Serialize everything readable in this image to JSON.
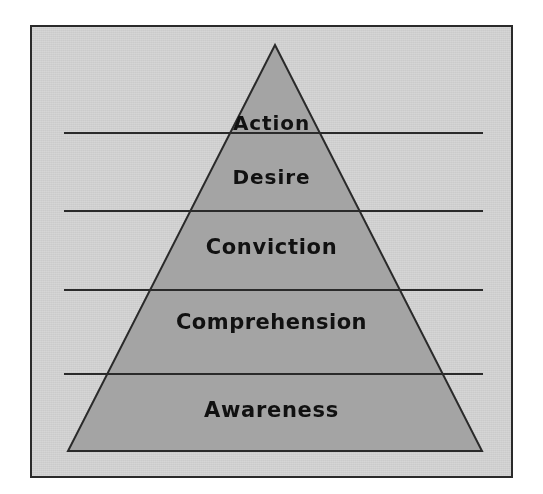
{
  "document": {
    "title": "AIDA Communication Pyramid",
    "clipped_header_text": ""
  },
  "colors": {
    "page_background": "#ffffff",
    "panel_fill": "#d6d6d6",
    "panel_border": "#2a2a2a",
    "pyramid_fill": "#a4a4a4",
    "pyramid_stroke": "#2a2a2a",
    "divider_line": "#2a2a2a",
    "label_text": "#111111"
  },
  "panel": {
    "x": 30,
    "y": 25,
    "width": 483,
    "height": 453,
    "border_width": 2
  },
  "pyramid": {
    "apex_x": 275,
    "apex_y": 45,
    "base_left_x": 68,
    "base_right_x": 482,
    "base_y": 451,
    "stroke_width": 2
  },
  "dividers": [
    {
      "name": "divider-action-desire",
      "x1": 64,
      "x2": 483,
      "y": 133
    },
    {
      "name": "divider-desire-conviction",
      "x1": 64,
      "x2": 483,
      "y": 211
    },
    {
      "name": "divider-conviction-comprehension",
      "x1": 64,
      "x2": 483,
      "y": 290
    },
    {
      "name": "divider-comprehension-awareness",
      "x1": 64,
      "x2": 483,
      "y": 374
    }
  ],
  "tiers": [
    {
      "id": "action",
      "label": "Action",
      "level": 5
    },
    {
      "id": "desire",
      "label": "Desire",
      "level": 4
    },
    {
      "id": "conviction",
      "label": "Conviction",
      "level": 3
    },
    {
      "id": "comprehension",
      "label": "Comprehension",
      "level": 2
    },
    {
      "id": "awareness",
      "label": "Awareness",
      "level": 1
    }
  ]
}
